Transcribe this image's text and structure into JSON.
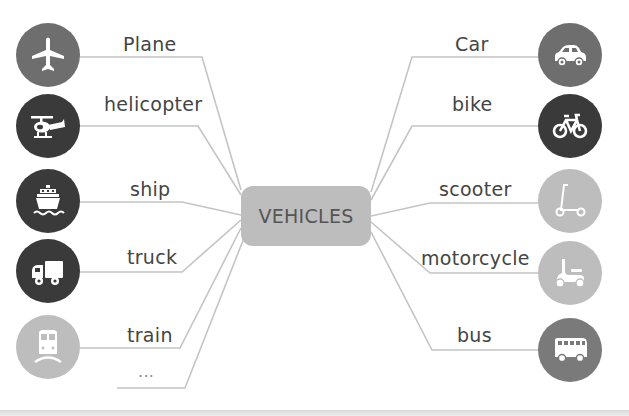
{
  "center": {
    "label": "VEHICLES",
    "color": "#bdbdbd"
  },
  "left_items": [
    {
      "label": "Plane",
      "icon": "plane-icon",
      "circle_color": "#6e6e6e"
    },
    {
      "label": "helicopter",
      "icon": "helicopter-icon",
      "circle_color": "#3a3a3a"
    },
    {
      "label": "ship",
      "icon": "ship-icon",
      "circle_color": "#3a3a3a"
    },
    {
      "label": "truck",
      "icon": "truck-icon",
      "circle_color": "#3a3a3a"
    },
    {
      "label": "train",
      "icon": "train-icon",
      "circle_color": "#bdbdbd"
    },
    {
      "label": "...",
      "icon": "",
      "circle_color": ""
    }
  ],
  "right_items": [
    {
      "label": "Car",
      "icon": "car-icon",
      "circle_color": "#6e6e6e"
    },
    {
      "label": "bike",
      "icon": "bicycle-icon",
      "circle_color": "#3a3a3a"
    },
    {
      "label": "scooter",
      "icon": "scooter-icon",
      "circle_color": "#bdbdbd"
    },
    {
      "label": "motorcycle",
      "icon": "motor-scooter-icon",
      "circle_color": "#bdbdbd"
    },
    {
      "label": "bus",
      "icon": "bus-icon",
      "circle_color": "#7a7a7a"
    }
  ],
  "line_color": "#c4c4c4"
}
